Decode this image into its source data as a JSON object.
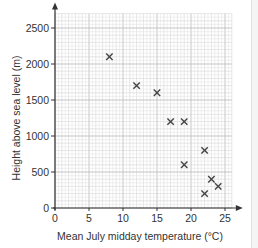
{
  "chart_data": {
    "type": "scatter",
    "title": "",
    "xlabel": "Mean July midday temperature (°C)",
    "ylabel": "Height above sea level (m)",
    "xlim": [
      0,
      26
    ],
    "ylim": [
      0,
      2700
    ],
    "xticks": [
      0,
      5,
      10,
      15,
      20,
      25
    ],
    "yticks": [
      0,
      500,
      1000,
      1500,
      2000,
      2500
    ],
    "grid": true,
    "marker": "x",
    "points": [
      {
        "x": 8,
        "y": 2100
      },
      {
        "x": 12,
        "y": 1700
      },
      {
        "x": 15,
        "y": 1600
      },
      {
        "x": 17,
        "y": 1200
      },
      {
        "x": 19,
        "y": 1200
      },
      {
        "x": 19,
        "y": 600
      },
      {
        "x": 22,
        "y": 800
      },
      {
        "x": 22,
        "y": 200
      },
      {
        "x": 23,
        "y": 400
      },
      {
        "x": 24,
        "y": 300
      }
    ]
  },
  "labels": {
    "xlabel": "Mean July midday temperature (°C)",
    "ylabel": "Height above sea level (m)"
  },
  "colors": {
    "axis": "#333333",
    "grid_major": "#b9b9b9",
    "grid_minor": "#e0e0e0",
    "marker": "#444444",
    "text": "#333333"
  }
}
